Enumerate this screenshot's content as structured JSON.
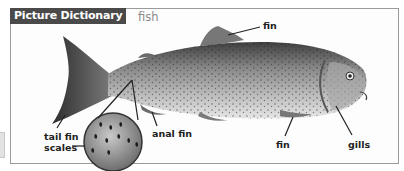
{
  "header": {
    "badge": "Picture Dictionary",
    "word": "fish"
  },
  "labels": {
    "fin_top": "fin",
    "tail_fin": "tail fin",
    "scales": "scales",
    "anal_fin": "anal fin",
    "fin_bottom": "fin",
    "gills": "gills"
  },
  "colors": {
    "badge_bg": "#4a4a4a",
    "badge_text": "#ffffff",
    "word_text": "#8a8a8a",
    "frame_border": "#9a9a9a"
  }
}
